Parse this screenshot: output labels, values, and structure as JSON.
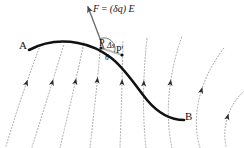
{
  "figure": {
    "background_color": "#ffffff",
    "width": 244,
    "height": 148,
    "labels": {
      "point_a": "A",
      "point_b": "B",
      "point_p": "P",
      "point_p_prime": "P'",
      "delta_s": "Δs",
      "theta": "θ",
      "force_expression": "F = (δq)E",
      "force_symbol": "F",
      "force_equals": "=",
      "force_charge": "(δq)",
      "force_field": "E"
    },
    "colors": {
      "path_curve": "#111111",
      "field_line": "#9a9a9a",
      "arrowhead": "#2b2b2b",
      "force_vector": "#6e6e6e",
      "tangent_segment": "#bdbdbd",
      "text": "#141414"
    },
    "path_curve": {
      "name": "charge-path-A-to-B",
      "stroke_width": 2.6,
      "d": "M 29 50 C 46 41, 62 40, 78 43 C 92 45.5, 100 50, 110 57 C 124 67, 134 84, 147 100 C 158 113, 170 120, 184 120"
    },
    "force_vector": {
      "name": "force-vector-F",
      "from": [
        104,
        49
      ],
      "to": [
        88,
        7
      ],
      "stroke_width": 1.4
    },
    "tangent_segment": {
      "name": "delta-s-segment",
      "from": [
        101,
        48
      ],
      "to": [
        122,
        55
      ],
      "stroke_width": 2.2
    },
    "theta_arc": {
      "name": "theta-angle-arc",
      "center": [
        104,
        49
      ],
      "radius": 11
    },
    "field_lines": [
      {
        "name": "field-line-1",
        "d": "M 6 146 C 14 120, 24 88, 40 46",
        "arrow_t": 0.6
      },
      {
        "name": "field-line-2",
        "d": "M 32 147 C 40 122, 50 90, 64 44",
        "arrow_t": 0.6
      },
      {
        "name": "field-line-3",
        "d": "M 60 148 C 66 122, 74 90, 84 42",
        "arrow_t": 0.6
      },
      {
        "name": "field-line-4",
        "d": "M 90 148 C 93 120, 97 88, 101 40",
        "arrow_t": 0.6
      },
      {
        "name": "field-line-5",
        "d": "M 120 148 C 121 120, 122 88, 123 40",
        "arrow_t": 0.58
      },
      {
        "name": "field-line-6",
        "d": "M 146 148 C 143 120, 142 86, 147 38",
        "arrow_t": 0.56
      },
      {
        "name": "field-line-7",
        "d": "M 172 148 C 166 120, 166 82, 182 36",
        "arrow_t": 0.55
      },
      {
        "name": "field-line-8",
        "d": "M 200 148 C 192 122, 196 84, 224 48",
        "arrow_t": 0.52
      },
      {
        "name": "field-line-9",
        "d": "M 226 146 C 222 128, 228 106, 243 92",
        "arrow_t": 0.45
      }
    ]
  }
}
